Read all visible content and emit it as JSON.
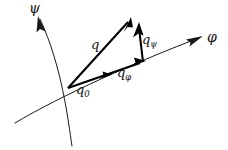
{
  "figure": {
    "background_color": "#ffffff",
    "ink_color": "#000000",
    "axis_color": "#1a1a1a"
  },
  "axes": [
    {
      "id": "psi",
      "label": "ψ",
      "name": "psi-coordinate-curve",
      "arrow_end": "top",
      "path": "M 72 146 C 68 120, 62 66, 40 19",
      "arrow_tip": [
        38,
        16
      ],
      "arrow_angle": -115
    },
    {
      "id": "phi",
      "label": "φ",
      "name": "phi-coordinate-curve",
      "arrow_end": "right",
      "path": "M 15 123 C 60 96, 140 60, 199 38",
      "arrow_tip": [
        202,
        37
      ],
      "arrow_angle": -20
    }
  ],
  "origin": {
    "label": "q",
    "subscript": "0",
    "point": [
      68,
      88
    ],
    "name": "origin-point-q0"
  },
  "vectors": [
    {
      "id": "q",
      "label": "q",
      "subscript": "",
      "name": "vector-q",
      "from": [
        68,
        88
      ],
      "to": [
        131,
        19
      ],
      "description": "resultant vector"
    },
    {
      "id": "q_phi",
      "label": "q",
      "subscript": "φ",
      "name": "vector-q-phi",
      "from": [
        68,
        88
      ],
      "to": [
        144,
        62
      ],
      "description": "component tangential to phi curve"
    },
    {
      "id": "q_psi",
      "label": "q",
      "subscript": "ψ",
      "name": "vector-q-psi",
      "from": [
        143,
        62
      ],
      "to": [
        139,
        24
      ],
      "description": "component along psi direction"
    }
  ],
  "labels": {
    "psi_axis": "ψ",
    "phi_axis": "φ",
    "q": "q",
    "q_zero_base": "q",
    "q_zero_sub": "0",
    "q_phi_base": "q",
    "q_phi_sub": "φ",
    "q_psi_base": "q",
    "q_psi_sub": "ψ"
  }
}
